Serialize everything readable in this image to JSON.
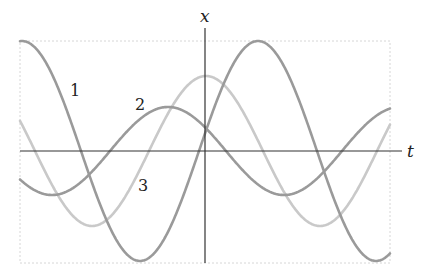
{
  "chart_data": {
    "type": "line",
    "title": "",
    "xlabel": "t",
    "ylabel": "x",
    "axis_labels": {
      "horizontal": "t",
      "vertical": "x"
    },
    "grid": false,
    "frame": "dotted",
    "origin_px": {
      "x": 205,
      "y": 151
    },
    "plot_box_px": {
      "left": 20,
      "top": 41,
      "right": 390,
      "bottom": 263
    },
    "series": [
      {
        "name": "1",
        "label": "1",
        "color": "#9a9a9a",
        "amplitude_px": 110,
        "period_px": 236,
        "peak_at_px": 22,
        "label_pos": {
          "x": 70,
          "y": 96
        }
      },
      {
        "name": "2",
        "label": "2",
        "color": "#9a9a9a",
        "amplitude_px": 44,
        "period_px": 232,
        "peak_at_px": 168,
        "label_pos": {
          "x": 135,
          "y": 110
        }
      },
      {
        "name": "3",
        "label": "3",
        "color": "#c9c9c9",
        "amplitude_px": 75,
        "period_px": 228,
        "peak_at_px": 206,
        "label_pos": {
          "x": 138,
          "y": 191
        }
      }
    ]
  },
  "axes": {
    "x_label": "x",
    "t_label": "t",
    "color": "#333333"
  }
}
